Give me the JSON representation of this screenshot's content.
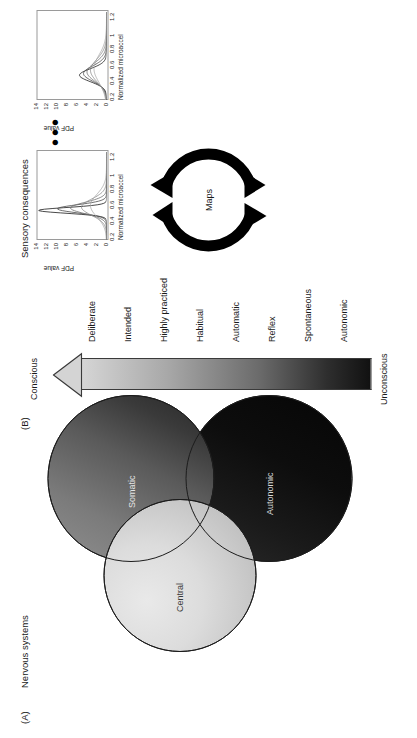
{
  "figure": {
    "panels": [
      {
        "letter": "(A)",
        "title": "Nervous systems"
      },
      {
        "letter": "(B)",
        "title": ""
      },
      {
        "letter": "",
        "title": "Sensory consequences"
      }
    ]
  },
  "panel_a": {
    "letter": "(A)",
    "title": "Nervous systems",
    "circles": [
      {
        "name": "Central",
        "fill": "#dcdcdc",
        "text_color": "#3a3a3a"
      },
      {
        "name": "Somatic",
        "fill": "#5a5a5a",
        "text_color": "#e4e4e4"
      },
      {
        "name": "Autonomic",
        "fill": "#0d0d0d",
        "text_color": "#d8d8d8"
      }
    ]
  },
  "panel_b": {
    "letter": "(B)",
    "arrow": {
      "head_end_label": "Conscious",
      "tail_end_label": "Unconscious",
      "side_label_top": "Voluntary",
      "side_label_bottom": "Involuntary",
      "gradient_from": "#d6d6d6",
      "gradient_to": "#111111"
    },
    "spectrum_labels": [
      "Deliberate",
      "Intended",
      "Highly practiced",
      "Habitual",
      "Automatic",
      "Reflex",
      "Spontaneous",
      "Autonomic"
    ]
  },
  "panel_c": {
    "title": "Sensory consequences",
    "cycle_label": "Maps",
    "ellipsis": "•••"
  },
  "chart_data": [
    {
      "type": "line",
      "title": "",
      "xlabel": "Normalized microaccel",
      "ylabel": "PDF value",
      "xticks": [
        "0.2",
        "0.4",
        "0.6",
        "0.8",
        "1",
        "1.2"
      ],
      "yticks": [
        "0",
        "2",
        "4",
        "6",
        "8",
        "10",
        "12",
        "14"
      ],
      "xlim": [
        0.15,
        1.25
      ],
      "ylim": [
        0,
        14
      ],
      "grid": false,
      "legend": "none",
      "series": [
        {
          "name": "curve-1",
          "peak_x": 0.52,
          "peak_y": 13.6,
          "width": 0.035,
          "color": "#1a1a1a"
        },
        {
          "name": "curve-2",
          "peak_x": 0.54,
          "peak_y": 9.8,
          "width": 0.05,
          "color": "#4a4a4a"
        },
        {
          "name": "curve-3",
          "peak_x": 0.55,
          "peak_y": 7.2,
          "width": 0.07,
          "color": "#6e6e6e"
        },
        {
          "name": "curve-4",
          "peak_x": 0.56,
          "peak_y": 5.0,
          "width": 0.1,
          "color": "#8c8c8c"
        },
        {
          "name": "curve-5",
          "peak_x": 0.58,
          "peak_y": 3.2,
          "width": 0.14,
          "color": "#a8a8a8"
        }
      ]
    },
    {
      "type": "line",
      "title": "",
      "xlabel": "Normalized microaccel",
      "ylabel": "PDF value",
      "xticks": [
        "0.2",
        "0.4",
        "0.6",
        "0.8",
        "1",
        "1.2"
      ],
      "yticks": [
        "0",
        "2",
        "4",
        "6",
        "8",
        "10",
        "12",
        "14"
      ],
      "xlim": [
        0.15,
        1.25
      ],
      "ylim": [
        0,
        14
      ],
      "grid": false,
      "legend": "none",
      "series": [
        {
          "name": "curve-1",
          "peak_x": 0.46,
          "peak_y": 5.4,
          "width": 0.08,
          "color": "#1a1a1a"
        },
        {
          "name": "curve-2",
          "peak_x": 0.48,
          "peak_y": 4.6,
          "width": 0.095,
          "color": "#4a4a4a"
        },
        {
          "name": "curve-3",
          "peak_x": 0.5,
          "peak_y": 3.9,
          "width": 0.115,
          "color": "#6e6e6e"
        },
        {
          "name": "curve-4",
          "peak_x": 0.52,
          "peak_y": 3.2,
          "width": 0.14,
          "color": "#8c8c8c"
        },
        {
          "name": "curve-5",
          "peak_x": 0.54,
          "peak_y": 2.5,
          "width": 0.17,
          "color": "#a8a8a8"
        }
      ]
    }
  ]
}
